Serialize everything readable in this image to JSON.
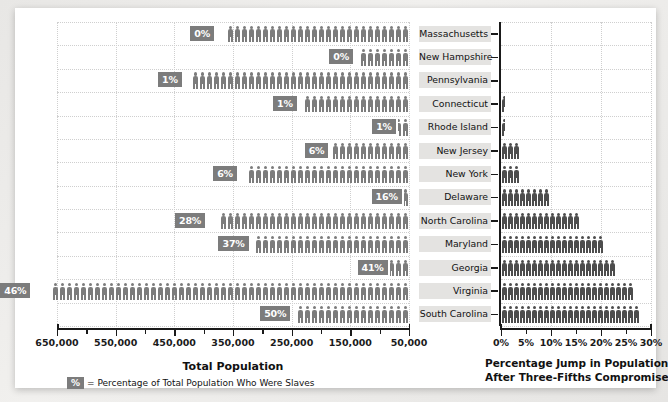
{
  "chart_data": {
    "type": "bar",
    "categories": [
      "Massachusetts",
      "New Hampshire",
      "Pennsylvania",
      "Connecticut",
      "Rhode Island",
      "New Jersey",
      "New York",
      "Delaware",
      "North Carolina",
      "Maryland",
      "Georgia",
      "Virginia",
      "South Carolina"
    ],
    "panels": [
      {
        "id": "total-population",
        "xlabel": "Total Population",
        "xlim": [
          650000,
          50000
        ],
        "axis_reversed": true,
        "ticks": [
          "650,000",
          "550,000",
          "450,000",
          "350,000",
          "250,000",
          "150,000",
          "50,000"
        ],
        "tick_values": [
          650000,
          550000,
          450000,
          350000,
          250000,
          150000,
          50000
        ],
        "minor_ticks": [
          600000,
          500000,
          400000,
          300000,
          200000,
          100000
        ],
        "grid": true,
        "unit": "pictogram person icons",
        "values": [
          379000,
          142000,
          434000,
          238000,
          69000,
          184000,
          340000,
          59000,
          394000,
          320000,
          83000,
          692000,
          249000
        ],
        "labels": [
          "0%",
          "0%",
          "1%",
          "1%",
          "1%",
          "6%",
          "6%",
          "16%",
          "28%",
          "37%",
          "41%",
          "46%",
          "50%"
        ],
        "label_meaning": "Percentage of Total Population Who Were Slaves"
      },
      {
        "id": "percentage-jump",
        "xlabel": "Percentage Jump in Population\nAfter Three-Fifths Compromise",
        "xlabel_line1": "Percentage Jump in Population",
        "xlabel_line2": "After Three-Fifths Compromise",
        "xlim": [
          0,
          30
        ],
        "ticks": [
          "0%",
          "5%",
          "10%",
          "15%",
          "20%",
          "25%",
          "30%"
        ],
        "tick_values": [
          0,
          5,
          10,
          15,
          20,
          25,
          30
        ],
        "grid": true,
        "values": [
          0,
          0,
          0.6,
          0.7,
          0.7,
          3.6,
          3.6,
          9.9,
          16.8,
          22.3,
          24.6,
          27.7,
          30.0
        ]
      }
    ],
    "legend": {
      "chip": "%",
      "text": "= Percentage of Total Population Who Were Slaves"
    },
    "colors": {
      "bar_light": "#7c7c7c",
      "bar_dark": "#4d4d4d",
      "label_chip": "#7c7c7c",
      "axis": "#1a1a1a",
      "grid": "#cfcfcf",
      "state_band": "#e4e3e1",
      "card": "#ffffff",
      "page": "#ecebe9"
    }
  }
}
